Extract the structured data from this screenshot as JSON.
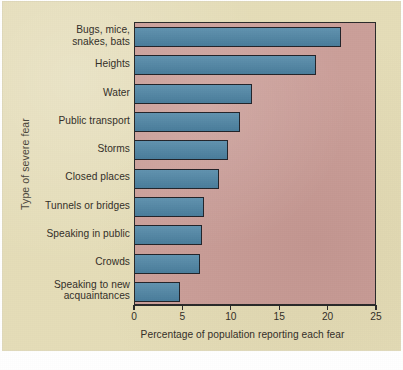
{
  "figure": {
    "background_color": "#e5ddb8",
    "plot_background_color": "#cb9f99",
    "bar_color": "#4f86a6",
    "axis_color": "#2a2a2a",
    "text_color": "#332f28"
  },
  "axes": {
    "y_title": "Type of severe fear",
    "x_title": "Percentage of population reporting each fear",
    "x_ticks": [
      "0",
      "5",
      "10",
      "15",
      "20",
      "25"
    ],
    "x_tick_values": [
      0,
      5,
      10,
      15,
      20,
      25
    ],
    "x_min": 0,
    "x_max": 25
  },
  "chart_data": {
    "type": "bar",
    "orientation": "horizontal",
    "title": "",
    "subtitle": "",
    "xlabel": "Percentage of population reporting each fear",
    "ylabel": "Type of severe fear",
    "xlim": [
      0,
      25
    ],
    "grid": false,
    "legend": false,
    "categories": [
      "Bugs, mice, snakes, bats",
      "Heights",
      "Water",
      "Public transport",
      "Storms",
      "Closed places",
      "Tunnels or bridges",
      "Speaking in public",
      "Crowds",
      "Speaking to new acquaintances"
    ],
    "category_lines": [
      [
        "Bugs, mice,",
        "snakes, bats"
      ],
      [
        "Heights"
      ],
      [
        "Water"
      ],
      [
        "Public transport"
      ],
      [
        "Storms"
      ],
      [
        "Closed places"
      ],
      [
        "Tunnels or bridges"
      ],
      [
        "Speaking in public"
      ],
      [
        "Crowds"
      ],
      [
        "Speaking to new",
        "acquaintances"
      ]
    ],
    "values": [
      21.3,
      18.7,
      12.1,
      10.8,
      9.6,
      8.7,
      7.1,
      6.9,
      6.7,
      4.6
    ],
    "series": [
      {
        "name": "Percentage of population reporting each fear",
        "values": [
          21.3,
          18.7,
          12.1,
          10.8,
          9.6,
          8.7,
          7.1,
          6.9,
          6.7,
          4.6
        ]
      }
    ]
  }
}
